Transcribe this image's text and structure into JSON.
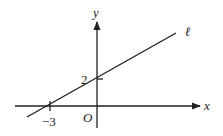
{
  "diagram": {
    "type": "coordinate-plane-line",
    "axes": {
      "x_label": "x",
      "y_label": "y",
      "origin_label": "O"
    },
    "line": {
      "label": "ℓ",
      "x_intercept": -3,
      "y_intercept": 2
    },
    "tick_labels": {
      "x_intercept_label": "−3",
      "y_intercept_label": "2"
    },
    "colors": {
      "stroke": "#222222",
      "background": "#ffffff"
    }
  }
}
